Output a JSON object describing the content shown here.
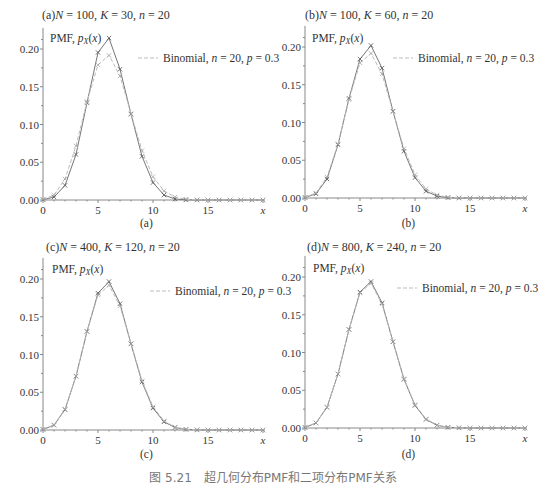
{
  "figure": {
    "caption": "图 5.21　超几何分布PMF和二项分布PMF关系"
  },
  "chart_data": [
    {
      "type": "line",
      "panel": "a",
      "title": "(a) N = 100, K = 30, n = 20",
      "sublabel": "(a)",
      "xlabel": "x",
      "ylabel": "PMF, p_X(x)",
      "xticks": [
        0,
        5,
        10,
        15
      ],
      "yticks": [
        "0.00",
        "0.05",
        "0.10",
        "0.15",
        "0.20"
      ],
      "xlim": [
        0,
        20
      ],
      "ylim": [
        0,
        0.22
      ],
      "legend": [
        "PMF, p_X(x)",
        "Binomial, n = 20, p = 0.3"
      ],
      "x": [
        0,
        1,
        2,
        3,
        4,
        5,
        6,
        7,
        8,
        9,
        10,
        11,
        12,
        13,
        14,
        15,
        16,
        17,
        18,
        19,
        20
      ],
      "series": [
        {
          "name": "Hypergeometric PMF",
          "style": "solid",
          "values": [
            0.0004,
            0.004,
            0.0194,
            0.0603,
            0.1288,
            0.1954,
            0.2145,
            0.1732,
            0.1137,
            0.0579,
            0.0231,
            0.0066,
            0.0013,
            0.0002,
            0,
            0,
            0,
            0,
            0,
            0,
            0
          ]
        },
        {
          "name": "Binomial, n = 20, p = 0.3",
          "style": "dashed",
          "values": [
            0.0008,
            0.0068,
            0.0278,
            0.0716,
            0.1304,
            0.1789,
            0.1916,
            0.1643,
            0.1144,
            0.0654,
            0.0308,
            0.012,
            0.0039,
            0.001,
            0.0002,
            0,
            0,
            0,
            0,
            0,
            0
          ]
        }
      ]
    },
    {
      "type": "line",
      "panel": "b",
      "title": "(b) N = 100, K = 60, n = 20",
      "sublabel": "(b)",
      "xlabel": "x",
      "ylabel": "PMF, p_X(x)",
      "xticks": [
        0,
        5,
        10,
        15
      ],
      "yticks": [
        "0.00",
        "0.05",
        "0.10",
        "0.15",
        "0.20"
      ],
      "xlim": [
        0,
        20
      ],
      "ylim": [
        0,
        0.22
      ],
      "legend": [
        "PMF, p_X(x)",
        "Binomial, n = 20, p = 0.3"
      ],
      "x": [
        0,
        1,
        2,
        3,
        4,
        5,
        6,
        7,
        8,
        9,
        10,
        11,
        12,
        13,
        14,
        15,
        16,
        17,
        18,
        19,
        20
      ],
      "series": [
        {
          "name": "Hypergeometric PMF",
          "style": "solid",
          "values": [
            0.0006,
            0.0055,
            0.0252,
            0.0705,
            0.132,
            0.184,
            0.202,
            0.172,
            0.115,
            0.062,
            0.027,
            0.009,
            0.0025,
            0.0005,
            0,
            0,
            0,
            0,
            0,
            0,
            0
          ]
        },
        {
          "name": "Binomial, n = 20, p = 0.3",
          "style": "dashed",
          "values": [
            0.0008,
            0.0068,
            0.0278,
            0.0716,
            0.1304,
            0.1789,
            0.1916,
            0.1643,
            0.1144,
            0.0654,
            0.0308,
            0.012,
            0.0039,
            0.001,
            0.0002,
            0,
            0,
            0,
            0,
            0,
            0
          ]
        }
      ]
    },
    {
      "type": "line",
      "panel": "c",
      "title": "(c) N = 400, K = 120, n = 20",
      "sublabel": "(c)",
      "xlabel": "x",
      "ylabel": "PMF, p_X(x)",
      "xticks": [
        0,
        5,
        10,
        15
      ],
      "yticks": [
        "0.00",
        "0.05",
        "0.10",
        "0.15",
        "0.20"
      ],
      "xlim": [
        0,
        20
      ],
      "ylim": [
        0,
        0.22
      ],
      "legend": [
        "PMF, p_X(x)",
        "Binomial, n = 20, p = 0.3"
      ],
      "x": [
        0,
        1,
        2,
        3,
        4,
        5,
        6,
        7,
        8,
        9,
        10,
        11,
        12,
        13,
        14,
        15,
        16,
        17,
        18,
        19,
        20
      ],
      "series": [
        {
          "name": "Hypergeometric PMF",
          "style": "solid",
          "values": [
            0.0007,
            0.0063,
            0.027,
            0.0713,
            0.1305,
            0.1812,
            0.1966,
            0.1673,
            0.1141,
            0.0635,
            0.029,
            0.0108,
            0.0033,
            0.0008,
            0.0001,
            0,
            0,
            0,
            0,
            0,
            0
          ]
        },
        {
          "name": "Binomial, n = 20, p = 0.3",
          "style": "dashed",
          "values": [
            0.0008,
            0.0068,
            0.0278,
            0.0716,
            0.1304,
            0.1789,
            0.1916,
            0.1643,
            0.1144,
            0.0654,
            0.0308,
            0.012,
            0.0039,
            0.001,
            0.0002,
            0,
            0,
            0,
            0,
            0,
            0
          ]
        }
      ]
    },
    {
      "type": "line",
      "panel": "d",
      "title": "(d) N = 800, K = 240, n = 20",
      "sublabel": "(d)",
      "xlabel": "x",
      "ylabel": "PMF, p_X(x)",
      "xticks": [
        0,
        5,
        10,
        15
      ],
      "yticks": [
        "0.00",
        "0.05",
        "0.10",
        "0.15",
        "0.20"
      ],
      "xlim": [
        0,
        20
      ],
      "ylim": [
        0,
        0.22
      ],
      "legend": [
        "PMF, p_X(x)",
        "Binomial, n = 20, p = 0.3"
      ],
      "x": [
        0,
        1,
        2,
        3,
        4,
        5,
        6,
        7,
        8,
        9,
        10,
        11,
        12,
        13,
        14,
        15,
        16,
        17,
        18,
        19,
        20
      ],
      "series": [
        {
          "name": "Hypergeometric PMF",
          "style": "solid",
          "values": [
            0.0007,
            0.0066,
            0.0274,
            0.0715,
            0.1305,
            0.18,
            0.194,
            0.1658,
            0.1142,
            0.0645,
            0.0299,
            0.0114,
            0.0036,
            0.0009,
            0.0002,
            0,
            0,
            0,
            0,
            0,
            0
          ]
        },
        {
          "name": "Binomial, n = 20, p = 0.3",
          "style": "dashed",
          "values": [
            0.0008,
            0.0068,
            0.0278,
            0.0716,
            0.1304,
            0.1789,
            0.1916,
            0.1643,
            0.1144,
            0.0654,
            0.0308,
            0.012,
            0.0039,
            0.001,
            0.0002,
            0,
            0,
            0,
            0,
            0,
            0
          ]
        }
      ]
    }
  ],
  "panels_layout": [
    {
      "ox": 43,
      "oy": 200,
      "titleX": 42,
      "titleY": 19,
      "pmfX": 50,
      "pmfY": 42,
      "legX": 138,
      "legY": 62,
      "subY": 227
    },
    {
      "ox": 305,
      "oy": 198,
      "titleX": 305,
      "titleY": 19,
      "pmfX": 312,
      "pmfY": 42,
      "legX": 393,
      "legY": 62,
      "subY": 227
    },
    {
      "ox": 43,
      "oy": 430,
      "titleX": 46,
      "titleY": 251,
      "pmfX": 52,
      "pmfY": 273,
      "legX": 150,
      "legY": 295,
      "subY": 458
    },
    {
      "ox": 305,
      "oy": 428,
      "titleX": 307,
      "titleY": 251,
      "pmfX": 313,
      "pmfY": 272,
      "legX": 397,
      "legY": 292,
      "subY": 458
    }
  ],
  "colors": {
    "axis": "#888888",
    "pmf_line": "#777777",
    "binomial_line": "#bbbbbb",
    "marker": "#555555",
    "text": "#333333"
  }
}
